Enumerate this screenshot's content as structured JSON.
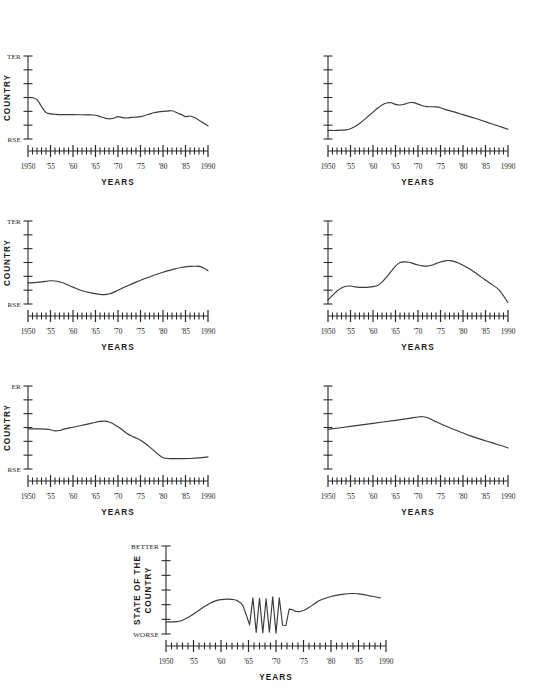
{
  "figure": {
    "background": "#ffffff",
    "line_color": "#3a3a3a",
    "axis_color": "#2a2a2a",
    "panel_count": 7
  },
  "common": {
    "xlabel": "YEARS",
    "ylabel": "STATE OF THE COUNTRY",
    "ylabel_line1": "STATE OF THE",
    "ylabel_line2": "COUNTRY",
    "ytop_label": "BETTER",
    "ybottom_label": "WORSE",
    "xticklabels": [
      "1950",
      "'55",
      "'60",
      "'65",
      "'70",
      "'75",
      "'80",
      "'85",
      "1990"
    ],
    "xlim": [
      1950,
      1990
    ],
    "ylim": [
      0,
      6
    ],
    "ytick_count": 7,
    "xtick_step": 1,
    "xtick_major_step": 5,
    "grid": false,
    "legend": false
  },
  "chart_data": [
    {
      "id": "panel-1",
      "position": "row1-left",
      "type": "line",
      "title": "",
      "xlabel": "YEARS",
      "ylabel": "STATE OF THE COUNTRY",
      "ylabel_visible_text": "COUNTRY",
      "ytop_label": "BETTER",
      "ytop_visible_text": "TER",
      "ybottom_label": "WORSE",
      "ybottom_visible_text": "RSE",
      "cropped_left": true,
      "xlim": [
        1950,
        1990
      ],
      "ylim": [
        0,
        6
      ],
      "xticklabels": [
        "1950",
        "'55",
        "'60",
        "'65",
        "'70",
        "'75",
        "'80",
        "'85",
        "1990"
      ],
      "x": [
        1950,
        1951,
        1952,
        1953,
        1954,
        1955,
        1956,
        1957,
        1958,
        1960,
        1962,
        1964,
        1965,
        1966,
        1967,
        1968,
        1969,
        1970,
        1971,
        1972,
        1973,
        1974,
        1975,
        1976,
        1977,
        1978,
        1979,
        1980,
        1981,
        1982,
        1983,
        1984,
        1985,
        1986,
        1987,
        1988,
        1989,
        1990
      ],
      "y": [
        3.0,
        2.98,
        2.85,
        2.35,
        1.92,
        1.82,
        1.79,
        1.76,
        1.76,
        1.76,
        1.75,
        1.74,
        1.72,
        1.62,
        1.52,
        1.46,
        1.5,
        1.62,
        1.55,
        1.52,
        1.56,
        1.58,
        1.62,
        1.7,
        1.8,
        1.9,
        1.96,
        2.0,
        2.02,
        2.04,
        1.92,
        1.78,
        1.62,
        1.66,
        1.55,
        1.36,
        1.15,
        0.95
      ]
    },
    {
      "id": "panel-2",
      "position": "row1-right",
      "type": "line",
      "title": "",
      "xlabel": "YEARS",
      "ylabel": "",
      "ytop_label": "",
      "ybottom_label": "",
      "cropped_left": false,
      "xlim": [
        1950,
        1990
      ],
      "ylim": [
        0,
        6
      ],
      "xticklabels": [
        "1950",
        "'55",
        "'60",
        "'65",
        "'70",
        "'75",
        "'80",
        "'85",
        "1990"
      ],
      "x": [
        1950,
        1952,
        1954,
        1955,
        1956,
        1957,
        1958,
        1959,
        1960,
        1961,
        1962,
        1963,
        1964,
        1965,
        1966,
        1967,
        1968,
        1969,
        1970,
        1971,
        1972,
        1973,
        1974,
        1975,
        1976,
        1978,
        1980,
        1982,
        1984,
        1986,
        1988,
        1990
      ],
      "y": [
        0.62,
        0.62,
        0.66,
        0.74,
        0.9,
        1.12,
        1.38,
        1.66,
        1.94,
        2.22,
        2.46,
        2.6,
        2.62,
        2.5,
        2.46,
        2.52,
        2.62,
        2.63,
        2.52,
        2.4,
        2.34,
        2.33,
        2.32,
        2.26,
        2.14,
        1.96,
        1.76,
        1.56,
        1.36,
        1.14,
        0.92,
        0.7
      ]
    },
    {
      "id": "panel-3",
      "position": "row2-left",
      "type": "line",
      "title": "",
      "xlabel": "YEARS",
      "ylabel": "STATE OF THE COUNTRY",
      "ylabel_visible_text": "COUNTRY",
      "ytop_label": "BETTER",
      "ytop_visible_text": "TER",
      "ybottom_label": "WORSE",
      "ybottom_visible_text": "RSE",
      "cropped_left": true,
      "xlim": [
        1950,
        1990
      ],
      "ylim": [
        0,
        6
      ],
      "xticklabels": [
        "1950",
        "'55",
        "'60",
        "'65",
        "'70",
        "'75",
        "'80",
        "'85",
        "1990"
      ],
      "x": [
        1950,
        1952,
        1954,
        1955,
        1956,
        1957,
        1958,
        1960,
        1962,
        1964,
        1966,
        1967,
        1968,
        1969,
        1970,
        1972,
        1974,
        1976,
        1978,
        1980,
        1982,
        1984,
        1986,
        1987,
        1988,
        1989,
        1990
      ],
      "y": [
        1.52,
        1.56,
        1.64,
        1.68,
        1.66,
        1.6,
        1.5,
        1.22,
        0.96,
        0.8,
        0.7,
        0.68,
        0.72,
        0.84,
        1.0,
        1.3,
        1.58,
        1.84,
        2.08,
        2.3,
        2.48,
        2.64,
        2.72,
        2.73,
        2.72,
        2.6,
        2.4
      ]
    },
    {
      "id": "panel-4",
      "position": "row2-right",
      "type": "line",
      "title": "",
      "xlabel": "YEARS",
      "ylabel": "",
      "ytop_label": "",
      "ybottom_label": "",
      "cropped_left": false,
      "xlim": [
        1950,
        1990
      ],
      "ylim": [
        0,
        6
      ],
      "xticklabels": [
        "1950",
        "'55",
        "'60",
        "'65",
        "'70",
        "'75",
        "'80",
        "'85",
        "1990"
      ],
      "x": [
        1950,
        1951,
        1952,
        1953,
        1954,
        1955,
        1956,
        1957,
        1958,
        1959,
        1960,
        1961,
        1962,
        1963,
        1964,
        1965,
        1966,
        1967,
        1968,
        1969,
        1970,
        1971,
        1972,
        1973,
        1974,
        1975,
        1976,
        1977,
        1978,
        1979,
        1980,
        1981,
        1982,
        1983,
        1984,
        1986,
        1988,
        1990
      ],
      "y": [
        0.3,
        0.62,
        0.94,
        1.16,
        1.28,
        1.3,
        1.24,
        1.2,
        1.2,
        1.22,
        1.26,
        1.34,
        1.58,
        1.94,
        2.34,
        2.74,
        3.0,
        3.05,
        3.02,
        2.92,
        2.82,
        2.76,
        2.74,
        2.8,
        2.92,
        3.04,
        3.12,
        3.14,
        3.08,
        2.96,
        2.8,
        2.62,
        2.42,
        2.2,
        1.96,
        1.5,
        1.02,
        0.1
      ]
    },
    {
      "id": "panel-5",
      "position": "row3-left",
      "type": "line",
      "title": "",
      "xlabel": "YEARS",
      "ylabel": "STATE OF THE COUNTRY",
      "ylabel_visible_text": "COUNTRY",
      "ytop_label": "BETTER",
      "ytop_visible_text": "ER",
      "ybottom_label": "WORSE",
      "ybottom_visible_text": "RSE",
      "cropped_left": true,
      "xlim": [
        1950,
        1990
      ],
      "ylim": [
        0,
        6
      ],
      "xticklabels": [
        "1950",
        "'55",
        "'60",
        "'65",
        "'70",
        "'75",
        "'80",
        "'85",
        "1990"
      ],
      "x": [
        1950,
        1952,
        1954,
        1955,
        1956,
        1957,
        1958,
        1960,
        1962,
        1964,
        1965,
        1966,
        1967,
        1968,
        1969,
        1970,
        1971,
        1972,
        1973,
        1974,
        1975,
        1976,
        1977,
        1978,
        1979,
        1980,
        1981,
        1982,
        1984,
        1986,
        1988,
        1990
      ],
      "y": [
        2.9,
        2.9,
        2.88,
        2.84,
        2.76,
        2.78,
        2.88,
        3.02,
        3.16,
        3.3,
        3.38,
        3.44,
        3.46,
        3.4,
        3.26,
        3.06,
        2.82,
        2.56,
        2.38,
        2.24,
        2.08,
        1.86,
        1.6,
        1.32,
        1.04,
        0.82,
        0.76,
        0.75,
        0.75,
        0.76,
        0.8,
        0.88
      ]
    },
    {
      "id": "panel-6",
      "position": "row3-right",
      "type": "line",
      "title": "",
      "xlabel": "YEARS",
      "ylabel": "",
      "ytop_label": "",
      "ybottom_label": "",
      "cropped_left": false,
      "xlim": [
        1950,
        1990
      ],
      "ylim": [
        0,
        6
      ],
      "xticklabels": [
        "1950",
        "'55",
        "'60",
        "'65",
        "'70",
        "'75",
        "'80",
        "'85",
        "1990"
      ],
      "x": [
        1950,
        1955,
        1960,
        1965,
        1968,
        1970,
        1971,
        1972,
        1973,
        1974,
        1976,
        1978,
        1980,
        1982,
        1984,
        1986,
        1988,
        1989,
        1990
      ],
      "y": [
        2.86,
        3.08,
        3.3,
        3.52,
        3.66,
        3.76,
        3.78,
        3.72,
        3.58,
        3.42,
        3.12,
        2.86,
        2.6,
        2.36,
        2.14,
        1.94,
        1.74,
        1.64,
        1.52
      ]
    },
    {
      "id": "panel-7",
      "position": "row4-center",
      "type": "line",
      "title": "",
      "xlabel": "YEARS",
      "ylabel": "STATE OF THE COUNTRY",
      "ylabel_visible_text": "STATE OF THE COUNTRY",
      "ytop_label": "BETTER",
      "ybottom_label": "WORSE",
      "cropped_left": false,
      "xlim": [
        1950,
        1990
      ],
      "ylim": [
        0,
        6
      ],
      "xticklabels": [
        "1950",
        "'55",
        "'60",
        "'65",
        "'70",
        "'75",
        "'80",
        "'85",
        "1990"
      ],
      "x": [
        1950,
        1952,
        1953,
        1954,
        1955,
        1956,
        1957,
        1958,
        1959,
        1960,
        1961,
        1962,
        1963,
        1964,
        1964.6,
        1965.2,
        1965.8,
        1966.4,
        1967.0,
        1967.6,
        1968.2,
        1968.8,
        1969.4,
        1970.0,
        1970.6,
        1971.2,
        1971.8,
        1972.4,
        1973.0,
        1973.6,
        1974.2,
        1975,
        1976,
        1977,
        1978,
        1980,
        1982,
        1984,
        1985,
        1986,
        1987,
        1988,
        1989
      ],
      "y": [
        0.82,
        0.84,
        0.94,
        1.12,
        1.36,
        1.62,
        1.88,
        2.1,
        2.26,
        2.34,
        2.38,
        2.36,
        2.26,
        1.92,
        1.3,
        0.62,
        2.46,
        0.1,
        2.44,
        0.08,
        2.4,
        0.12,
        2.54,
        0.06,
        2.46,
        0.6,
        0.58,
        1.7,
        1.66,
        1.54,
        1.52,
        1.6,
        1.8,
        2.06,
        2.3,
        2.56,
        2.7,
        2.76,
        2.74,
        2.68,
        2.6,
        2.54,
        2.46
      ]
    }
  ]
}
